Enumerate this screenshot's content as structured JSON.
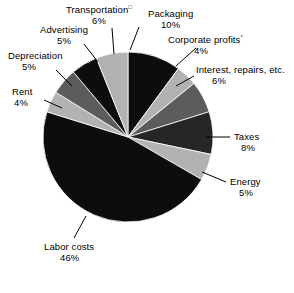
{
  "chart_data": {
    "type": "pie",
    "title": "",
    "subtitle": "",
    "xlabel": "",
    "ylabel": "",
    "legend_position": "none",
    "grid": false,
    "units": "percent",
    "total": 100,
    "start_angle_deg": 0,
    "direction": "clockwise",
    "categories": [
      "Packaging",
      "Corporate profits",
      "Interest, repairs, etc.",
      "Taxes",
      "Energy",
      "Labor costs",
      "Rent",
      "Depreciation",
      "Advertising",
      "Transportation"
    ],
    "values": [
      10,
      4,
      6,
      8,
      5,
      46,
      4,
      5,
      5,
      6
    ],
    "slices": [
      {
        "label": "Packaging",
        "value": 10,
        "pct_text": "10%",
        "color": "#0d0d0d",
        "footnote": ""
      },
      {
        "label": "Corporate profits",
        "value": 4,
        "pct_text": "4%",
        "color": "#b2b2b2",
        "footnote": "°"
      },
      {
        "label": "Interest, repairs, etc.",
        "value": 6,
        "pct_text": "6%",
        "color": "#5c5c5c",
        "footnote": ""
      },
      {
        "label": "Taxes",
        "value": 8,
        "pct_text": "8%",
        "color": "#262626",
        "footnote": ""
      },
      {
        "label": "Energy",
        "value": 5,
        "pct_text": "5%",
        "color": "#b2b2b2",
        "footnote": ""
      },
      {
        "label": "Labor costs",
        "value": 46,
        "pct_text": "46%",
        "color": "#0d0d0d",
        "footnote": ""
      },
      {
        "label": "Rent",
        "value": 4,
        "pct_text": "4%",
        "color": "#b2b2b2",
        "footnote": ""
      },
      {
        "label": "Depreciation",
        "value": 5,
        "pct_text": "5%",
        "color": "#5c5c5c",
        "footnote": ""
      },
      {
        "label": "Advertising",
        "value": 5,
        "pct_text": "5%",
        "color": "#0d0d0d",
        "footnote": ""
      },
      {
        "label": "Transportation",
        "value": 6,
        "pct_text": "6%",
        "color": "#b2b2b2",
        "footnote": "□"
      }
    ],
    "geometry": {
      "cx": 128,
      "cy": 137,
      "r": 85
    },
    "colors": {
      "background": "#ffffff",
      "text": "#000000",
      "leader_line": "#000000",
      "black": "#0d0d0d",
      "near_black": "#262626",
      "mid_gray": "#5c5c5c",
      "light_gray": "#b2b2b2"
    },
    "labels_layout": [
      {
        "key": "packaging",
        "x": 148,
        "y": 10,
        "align": "l"
      },
      {
        "key": "corporate",
        "x": 168,
        "y": 36,
        "align": "l"
      },
      {
        "key": "interest",
        "x": 196,
        "y": 66,
        "align": "l"
      },
      {
        "key": "taxes",
        "x": 232,
        "y": 133,
        "align": "l"
      },
      {
        "key": "energy",
        "x": 228,
        "y": 178,
        "align": "l"
      },
      {
        "key": "labor",
        "x": 44,
        "y": 243,
        "align": "l"
      },
      {
        "key": "rent",
        "x": 10,
        "y": 88,
        "align": "l"
      },
      {
        "key": "depreciation",
        "x": 8,
        "y": 52,
        "align": "l"
      },
      {
        "key": "advertising",
        "x": 40,
        "y": 26,
        "align": "l"
      },
      {
        "key": "transport",
        "x": 66,
        "y": 6,
        "align": "l"
      }
    ]
  }
}
